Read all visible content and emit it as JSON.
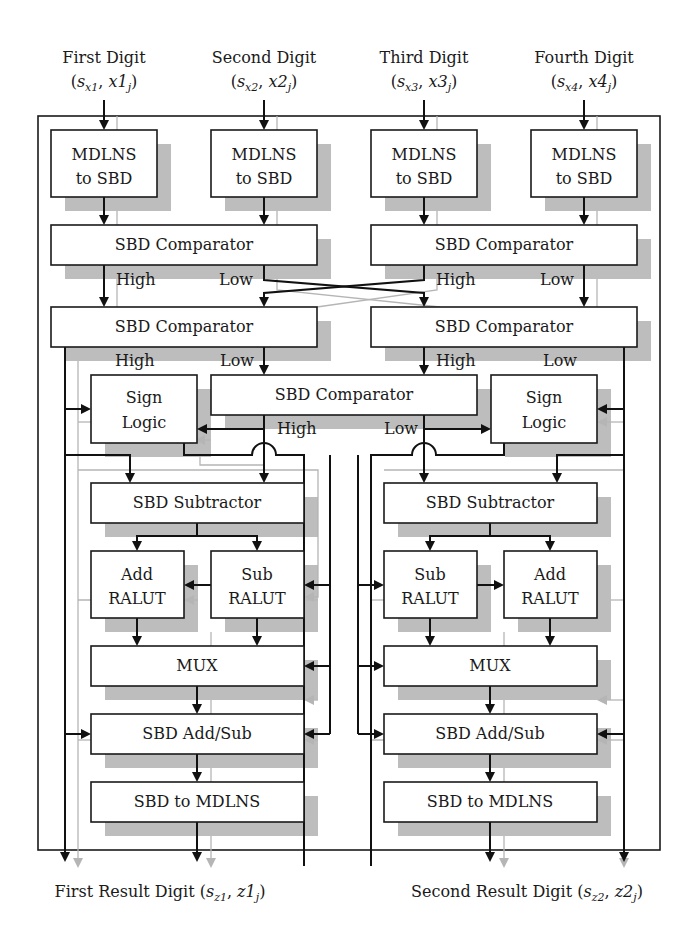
{
  "diagram": {
    "type": "block-diagram",
    "inputs": [
      {
        "title": "First Digit",
        "sign": "s",
        "sign_sub": "x1",
        "val": "x1",
        "val_sub": "j"
      },
      {
        "title": "Second Digit",
        "sign": "s",
        "sign_sub": "x2",
        "val": "x2",
        "val_sub": "j"
      },
      {
        "title": "Third Digit",
        "sign": "s",
        "sign_sub": "x3",
        "val": "x3",
        "val_sub": "j"
      },
      {
        "title": "Fourth Digit",
        "sign": "s",
        "sign_sub": "x4",
        "val": "x4",
        "val_sub": "j"
      }
    ],
    "converters_in": [
      {
        "line1": "MDLNS",
        "line2": "to SBD"
      },
      {
        "line1": "MDLNS",
        "line2": "to SBD"
      },
      {
        "line1": "MDLNS",
        "line2": "to SBD"
      },
      {
        "line1": "MDLNS",
        "line2": "to SBD"
      }
    ],
    "comparators": {
      "row1_left": "SBD Comparator",
      "row1_right": "SBD Comparator",
      "row2_left": "SBD Comparator",
      "row2_right": "SBD Comparator",
      "middle": "SBD Comparator"
    },
    "edge_labels": {
      "high": "High",
      "low": "Low"
    },
    "sign_logic": {
      "line1": "Sign",
      "line2": "Logic"
    },
    "subtractor": "SBD Subtractor",
    "ralut": {
      "add_line1": "Add",
      "sub_line1": "Sub",
      "line2": "RALUT"
    },
    "mux": "MUX",
    "add_sub": "SBD Add/Sub",
    "converter_out": "SBD to MDLNS",
    "outputs": [
      {
        "title": "First Result Digit",
        "sign": "s",
        "sign_sub": "z1",
        "val": "z1",
        "val_sub": "j"
      },
      {
        "title": "Second Result Digit",
        "sign": "s",
        "sign_sub": "z2",
        "val": "z2",
        "val_sub": "j"
      }
    ],
    "colors": {
      "line": "#111111",
      "secondary_line": "#b5b5b5",
      "shadow": "#bdbdbd",
      "box_fill": "#ffffff"
    }
  }
}
